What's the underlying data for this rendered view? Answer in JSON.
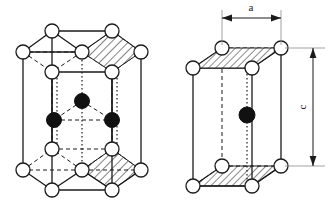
{
  "figure": {
    "background_color": "#ffffff",
    "line_color": "#1a1a1a",
    "open_atom_fill": "#ffffff",
    "filled_atom_fill": "#111111",
    "hatch_color": "#1a1a1a",
    "panels": [
      {
        "name": "hexagonal-prism-cell",
        "description": "Full hexagonal prism showing corner, face-center and interior atoms"
      },
      {
        "name": "primitive-rhombic-cell",
        "description": "Primitive rhombic prism unit cell with lattice parameters"
      }
    ]
  },
  "dimensions": {
    "a_label": "a",
    "c_label": "c"
  },
  "atoms": {
    "open_atom_name": "open-atom",
    "filled_atom_name": "filled-atom",
    "open_radius": 7,
    "filled_radius": 7,
    "left_panel": {
      "top_hex": [
        {
          "cx": 23,
          "cy": 52
        },
        {
          "cx": 52,
          "cy": 31
        },
        {
          "cx": 112,
          "cy": 31
        },
        {
          "cx": 141,
          "cy": 52
        },
        {
          "cx": 112,
          "cy": 72
        },
        {
          "cx": 52,
          "cy": 72
        },
        {
          "cx": 82,
          "cy": 52
        }
      ],
      "bottom_hex": [
        {
          "cx": 23,
          "cy": 170
        },
        {
          "cx": 52,
          "cy": 149
        },
        {
          "cx": 112,
          "cy": 149
        },
        {
          "cx": 141,
          "cy": 170
        },
        {
          "cx": 112,
          "cy": 190
        },
        {
          "cx": 52,
          "cy": 190
        },
        {
          "cx": 82,
          "cy": 170
        }
      ],
      "interior": [
        {
          "cx": 82,
          "cy": 101
        },
        {
          "cx": 54,
          "cy": 120
        },
        {
          "cx": 112,
          "cy": 120
        }
      ]
    },
    "right_panel": {
      "top_face": [
        {
          "cx": 193,
          "cy": 68
        },
        {
          "cx": 222,
          "cy": 48
        },
        {
          "cx": 281,
          "cy": 48
        },
        {
          "cx": 252,
          "cy": 68
        }
      ],
      "bottom_face": [
        {
          "cx": 193,
          "cy": 186
        },
        {
          "cx": 222,
          "cy": 166
        },
        {
          "cx": 281,
          "cy": 166
        },
        {
          "cx": 252,
          "cy": 186
        }
      ],
      "interior": [
        {
          "cx": 247,
          "cy": 115
        }
      ]
    }
  }
}
